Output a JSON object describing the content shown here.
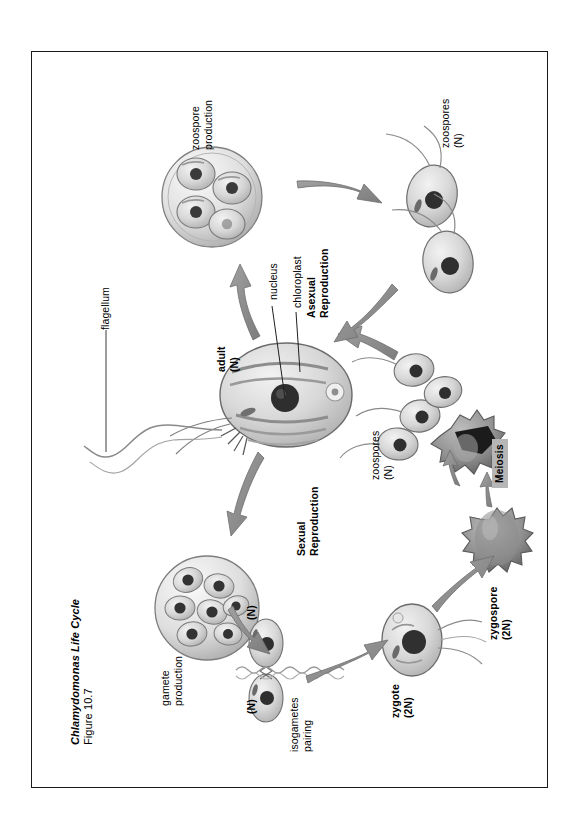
{
  "slide": {
    "title_italic": "Chlamydomonas Life Cycle",
    "title_figure": "Figure 10.7"
  },
  "labels": {
    "flagellum": "flagellum",
    "nucleus": "nucleus",
    "chloroplast": "chloroplast",
    "adult": "adult\n(N)",
    "adult_name": "adult",
    "adult_ploidy": "(N)",
    "asexual_reproduction": "Asexual\nReproduction",
    "asexual_line1": "Asexual",
    "asexual_line2": "Reproduction",
    "sexual_reproduction": "Sexual\nReproduction",
    "sexual_line1": "Sexual",
    "sexual_line2": "Reproduction",
    "zoospore_production_l1": "zoospore",
    "zoospore_production_l2": "production",
    "zoospores_asexual_l1": "zoospores",
    "zoospores_asexual_l2": "(N)",
    "zoospores_sexual_l1": "zoospores",
    "zoospores_sexual_l2": "(N)",
    "gamete_production_l1": "gamete",
    "gamete_production_l2": "production",
    "isogamete_top_ploidy": "(N)",
    "isogamete_bottom_ploidy": "(N)",
    "isogametes_pairing_l1": "isogametes",
    "isogametes_pairing_l2": "pairing",
    "zygote_l1": "zygote",
    "zygote_l2": "(2N)",
    "zygospore_l1": "zygospore",
    "zygospore_l2": "(2N)",
    "meiosis": "Meiosis"
  },
  "colors": {
    "border": "#1a1a1a",
    "text": "#000000",
    "arrow_fill": "#8e8e8e",
    "arrow_stroke": "#6f6f6f",
    "cell_fill": "#d2d2d2",
    "cell_stroke": "#6a6a6a",
    "nucleus": "#303030",
    "zygospore_fill": "#8a8a8a",
    "meiosis_badge_bg": "#b6b6b6",
    "page_background": "#ffffff"
  }
}
